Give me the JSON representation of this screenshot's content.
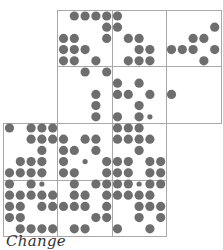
{
  "caption": "Change",
  "colors": {
    "dot": "#6e6e6e",
    "border": "#a8a8a8",
    "background": "#ffffff"
  },
  "grid": {
    "col_x0": 9.5,
    "col_pitch": 10.8,
    "row_y0": 16,
    "row_pitch": 11.2,
    "dot_r": 4.6,
    "small_r": 2.6
  },
  "blocks": [
    {
      "col": 1,
      "row": 0
    },
    {
      "col": 2,
      "row": 0
    },
    {
      "col": 3,
      "row": 0
    },
    {
      "col": 1,
      "row": 1
    },
    {
      "col": 2,
      "row": 1
    },
    {
      "col": 3,
      "row": 1
    },
    {
      "col": 0,
      "row": 2
    },
    {
      "col": 1,
      "row": 2
    },
    {
      "col": 2,
      "row": 2
    },
    {
      "col": 0,
      "row": 3
    },
    {
      "col": 1,
      "row": 3
    },
    {
      "col": 2,
      "row": 3
    }
  ],
  "block_geometry": {
    "x": [
      3,
      57,
      112,
      166,
      221
    ],
    "y": [
      10,
      66,
      123,
      180,
      236
    ]
  },
  "rows": [
    {
      "r": 0,
      "dots": [
        6,
        7,
        8,
        9,
        10
      ],
      "small": []
    },
    {
      "r": 1,
      "dots": [
        9,
        10,
        19
      ],
      "small": []
    },
    {
      "r": 2,
      "dots": [
        5,
        6,
        9,
        11,
        12,
        17,
        18
      ],
      "small": []
    },
    {
      "r": 3,
      "dots": [
        5,
        6,
        7,
        12,
        13,
        15,
        16,
        17,
        19
      ],
      "small": []
    },
    {
      "r": 4,
      "dots": [
        5,
        6,
        8,
        11,
        12,
        13,
        18
      ],
      "small": []
    },
    {
      "r": 5,
      "dots": [
        7,
        9
      ],
      "small": []
    },
    {
      "r": 6,
      "dots": [
        10,
        12
      ],
      "small": []
    },
    {
      "r": 7,
      "dots": [
        8,
        10,
        11,
        13,
        15
      ],
      "small": []
    },
    {
      "r": 8,
      "dots": [
        8,
        12
      ],
      "small": []
    },
    {
      "r": 9,
      "dots": [
        8,
        10,
        12
      ],
      "small": [
        13
      ]
    },
    {
      "r": 10,
      "dots": [
        0,
        2,
        3,
        4,
        10,
        11,
        12
      ],
      "small": []
    },
    {
      "r": 11,
      "dots": [
        2,
        3,
        4,
        5,
        7,
        8,
        10,
        11,
        12,
        13
      ],
      "small": []
    },
    {
      "r": 12,
      "dots": [
        3,
        5,
        6,
        8,
        12
      ],
      "small": []
    },
    {
      "r": 13,
      "dots": [
        1,
        2,
        3,
        5,
        9,
        10,
        11,
        13,
        14
      ],
      "small": [
        7
      ]
    },
    {
      "r": 14,
      "dots": [
        0,
        1,
        2,
        3,
        5,
        6,
        9,
        10,
        11,
        13,
        14
      ],
      "small": []
    },
    {
      "r": 15,
      "dots": [
        0,
        2,
        6,
        8,
        9,
        10,
        11,
        13,
        14
      ],
      "small": [
        3,
        12
      ]
    },
    {
      "r": 16,
      "dots": [
        0,
        1,
        2,
        3,
        4,
        6,
        7,
        9,
        10,
        11,
        12,
        13
      ],
      "small": []
    },
    {
      "r": 17,
      "dots": [
        0,
        1,
        3,
        4,
        5,
        6,
        7,
        9,
        12,
        13,
        14
      ],
      "small": []
    },
    {
      "r": 18,
      "dots": [
        0,
        1,
        8,
        9,
        12,
        14
      ],
      "small": []
    },
    {
      "r": 19,
      "dots": [
        1,
        2,
        3,
        4,
        6,
        7,
        10,
        13
      ],
      "small": []
    }
  ]
}
